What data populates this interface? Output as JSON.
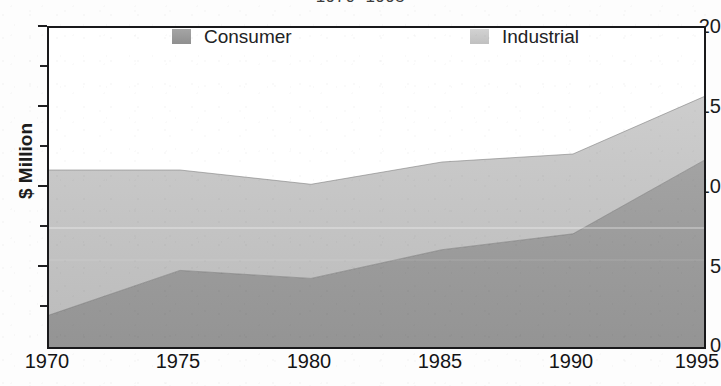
{
  "chart_data": {
    "type": "area",
    "stacked": true,
    "title": "1970–1995",
    "xlabel": "",
    "ylabel": "$ Million",
    "x": [
      1970,
      1975,
      1980,
      1985,
      1990,
      1995
    ],
    "xtick_labels": [
      "1970",
      "1975",
      "1980",
      "1985",
      "1990",
      "1995"
    ],
    "ytick_labels": [
      "0",
      "5",
      "10",
      "15",
      "20"
    ],
    "ytick_values": [
      0,
      5,
      10,
      15,
      20
    ],
    "yminor_values": [
      2.5,
      7.5,
      12.5,
      17.5
    ],
    "xlim": [
      1970,
      1995
    ],
    "ylim": [
      0,
      20
    ],
    "grid": false,
    "legend_position": "inside-top",
    "series": [
      {
        "name": "Consumer",
        "color": "#9a9a9a",
        "values": [
          2.0,
          4.8,
          4.3,
          6.1,
          7.1,
          11.7
        ]
      },
      {
        "name": "Industrial",
        "color": "#c6c6c6",
        "values": [
          9.1,
          6.3,
          5.9,
          5.5,
          5.0,
          4.0
        ]
      }
    ],
    "totals": [
      11.1,
      11.1,
      10.2,
      11.6,
      12.1,
      15.7
    ],
    "annotations": []
  },
  "legend": {
    "entries": [
      {
        "label": "Consumer",
        "swatch_color": "#9a9a9a"
      },
      {
        "label": "Industrial",
        "swatch_color": "#c9c9c9"
      }
    ]
  },
  "axes": {
    "frame_color": "#19191b",
    "tick_color": "#1d1d1f",
    "label_color": "#1b1b1b"
  }
}
